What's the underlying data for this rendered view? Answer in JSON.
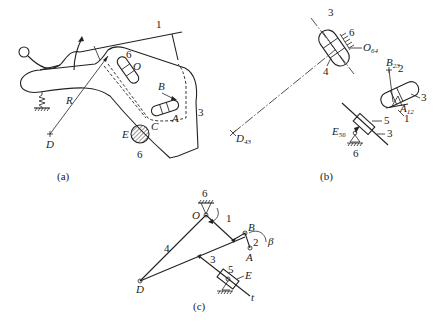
{
  "figure": {
    "panels": [
      {
        "id": "a",
        "caption": "(a)",
        "labels": {
          "link1": "1",
          "link3": "3",
          "link6_top": "6",
          "link6_bottom": "6",
          "O": "O",
          "B": "B",
          "A": "A",
          "C": "C",
          "E": "E",
          "D": "D",
          "R": "R"
        }
      },
      {
        "id": "b",
        "caption": "(b)",
        "labels": {
          "link3_top": "3",
          "link6_top": "6",
          "link4": "4",
          "O64": "O",
          "O64_sub": "64",
          "D43": "D",
          "D43_sub": "43",
          "B23": "B",
          "B23_sub": "23",
          "link2": "2",
          "link3_right": "3",
          "A12": "A",
          "A12_sub": "12",
          "link1": "1",
          "link5": "5",
          "E56": "E",
          "E56_sub": "56",
          "link3_bottom": "3",
          "link6_bottom": "6"
        }
      },
      {
        "id": "c",
        "caption": "(c)",
        "labels": {
          "link6": "6",
          "O": "O",
          "link1": "1",
          "B": "B",
          "link2": "2",
          "beta": "β",
          "A": "A",
          "link4": "4",
          "link3": "3",
          "link5": "5",
          "E": "E",
          "t": "t",
          "D": "D"
        }
      }
    ]
  }
}
